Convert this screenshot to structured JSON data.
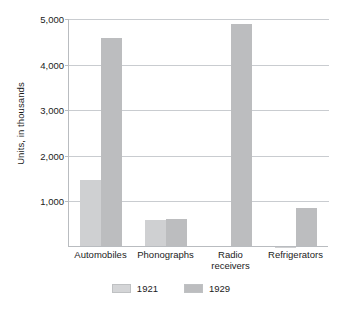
{
  "chart_data": {
    "type": "bar",
    "title": "",
    "subtitle": "",
    "xlabel": "",
    "ylabel": "Units, in thousands",
    "categories": [
      "Automobiles",
      "Phonographs",
      "Radio\nreceivers",
      "Refrigerators"
    ],
    "series": [
      {
        "name": "1921",
        "color": "#cfd0d2",
        "values": [
          1468,
          597,
          12,
          5
        ]
      },
      {
        "name": "1929",
        "color": "#bcbdbf",
        "values": [
          4587,
          605,
          4900,
          850
        ]
      }
    ],
    "ylim": [
      0,
      5000
    ],
    "yticks": [
      1000,
      2000,
      3000,
      4000,
      5000
    ],
    "ytick_labels": [
      "1,000",
      "2,000",
      "3,000",
      "4,000",
      "5,000"
    ],
    "grid": true,
    "legend_position": "bottom"
  },
  "legend": {
    "items": [
      {
        "label": "1921"
      },
      {
        "label": "1929"
      }
    ]
  }
}
